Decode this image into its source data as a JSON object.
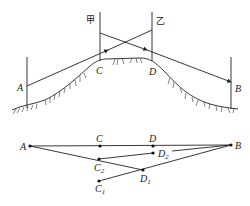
{
  "top_diagram": {
    "labels": {
      "A": "A",
      "B": "B",
      "C": "C",
      "D": "D",
      "jia": "甲",
      "yi": "乙"
    }
  },
  "bottom_diagram": {
    "labels": {
      "A": "A",
      "B": "B",
      "C": "C",
      "D": "D",
      "C2_base": "C",
      "C2_sub": "2",
      "D2_base": "D",
      "D2_sub": "2",
      "D1_base": "D",
      "D1_sub": "1",
      "C1_base": "C",
      "C1_sub": "1"
    }
  }
}
